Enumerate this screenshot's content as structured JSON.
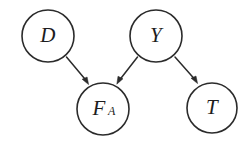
{
  "diagram": {
    "type": "dag",
    "background_color": "#ffffff",
    "stroke_color": "#2b2b2b",
    "label_color": "#1d1d1d",
    "nodes": [
      {
        "id": "D",
        "label": "D",
        "subscript": "",
        "cx": 48,
        "cy": 36,
        "r": 26
      },
      {
        "id": "Y",
        "label": "Y",
        "subscript": "",
        "cx": 156,
        "cy": 36,
        "r": 26
      },
      {
        "id": "FA",
        "label": "F",
        "subscript": "A",
        "cx": 103,
        "cy": 109,
        "r": 26
      },
      {
        "id": "T",
        "label": "T",
        "subscript": "",
        "cx": 212,
        "cy": 108,
        "r": 25
      }
    ],
    "edges": [
      {
        "id": "D-to-FA",
        "from": "D",
        "to": "FA",
        "directed": true
      },
      {
        "id": "Y-to-FA",
        "from": "Y",
        "to": "FA",
        "directed": true
      },
      {
        "id": "Y-to-T",
        "from": "Y",
        "to": "T",
        "directed": true
      }
    ]
  }
}
